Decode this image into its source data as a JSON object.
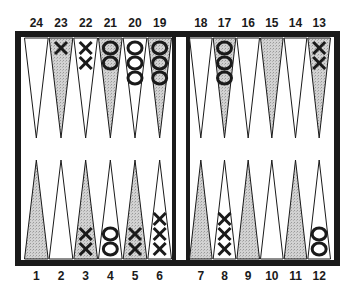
{
  "colors": {
    "frame": "#1a1a1a",
    "shaded_point": "#c8c8c8",
    "light_point": "#ffffff",
    "checker_stroke": "#1a1a1a"
  },
  "top_labels": [
    "24",
    "23",
    "22",
    "21",
    "20",
    "19",
    "18",
    "17",
    "16",
    "15",
    "14",
    "13"
  ],
  "bottom_labels": [
    "1",
    "2",
    "3",
    "4",
    "5",
    "6",
    "7",
    "8",
    "9",
    "10",
    "11",
    "12"
  ],
  "points": [
    {
      "point": 1,
      "shaded": true,
      "checker": "",
      "count": 0
    },
    {
      "point": 2,
      "shaded": false,
      "checker": "",
      "count": 0
    },
    {
      "point": 3,
      "shaded": true,
      "checker": "X",
      "count": 2
    },
    {
      "point": 4,
      "shaded": false,
      "checker": "O",
      "count": 2
    },
    {
      "point": 5,
      "shaded": true,
      "checker": "X",
      "count": 2
    },
    {
      "point": 6,
      "shaded": false,
      "checker": "X",
      "count": 3
    },
    {
      "point": 7,
      "shaded": true,
      "checker": "",
      "count": 0
    },
    {
      "point": 8,
      "shaded": false,
      "checker": "X",
      "count": 3
    },
    {
      "point": 9,
      "shaded": true,
      "checker": "",
      "count": 0
    },
    {
      "point": 10,
      "shaded": false,
      "checker": "",
      "count": 0
    },
    {
      "point": 11,
      "shaded": true,
      "checker": "",
      "count": 0
    },
    {
      "point": 12,
      "shaded": false,
      "checker": "O",
      "count": 2
    },
    {
      "point": 13,
      "shaded": true,
      "checker": "X",
      "count": 2
    },
    {
      "point": 14,
      "shaded": false,
      "checker": "",
      "count": 0
    },
    {
      "point": 15,
      "shaded": true,
      "checker": "",
      "count": 0
    },
    {
      "point": 16,
      "shaded": false,
      "checker": "",
      "count": 0
    },
    {
      "point": 17,
      "shaded": true,
      "checker": "O",
      "count": 3
    },
    {
      "point": 18,
      "shaded": false,
      "checker": "",
      "count": 0
    },
    {
      "point": 19,
      "shaded": true,
      "checker": "O",
      "count": 3
    },
    {
      "point": 20,
      "shaded": false,
      "checker": "O",
      "count": 3
    },
    {
      "point": 21,
      "shaded": true,
      "checker": "O",
      "count": 2
    },
    {
      "point": 22,
      "shaded": false,
      "checker": "X",
      "count": 2
    },
    {
      "point": 23,
      "shaded": true,
      "checker": "X",
      "count": 1
    },
    {
      "point": 24,
      "shaded": false,
      "checker": "",
      "count": 0
    }
  ]
}
